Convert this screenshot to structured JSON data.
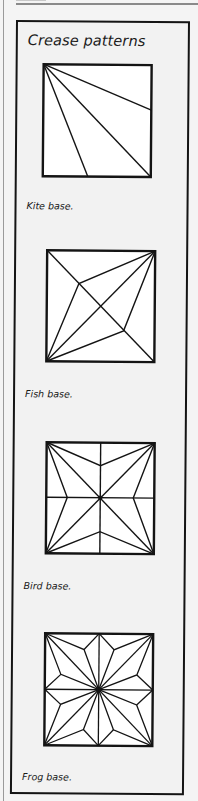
{
  "title": "Crease patterns",
  "patterns": [
    {
      "id": "kite",
      "caption": "Kite base."
    },
    {
      "id": "fish",
      "caption": "Fish base."
    },
    {
      "id": "bird",
      "caption": "Bird base."
    },
    {
      "id": "frog",
      "caption": "Frog base."
    }
  ],
  "colors": {
    "ink": "#141414",
    "paper": "#f2f2f2",
    "square_fill": "#ffffff"
  }
}
